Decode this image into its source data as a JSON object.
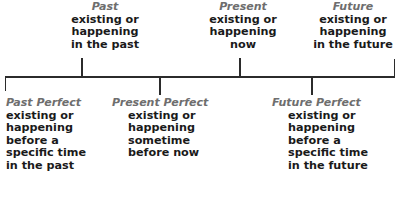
{
  "diagram": {
    "line_color": "#2b2b2b",
    "name_color": "#6e6e6e",
    "text_color": "#1a1a1a",
    "background": "#ffffff"
  },
  "upper_row": {
    "past": {
      "name": "Past",
      "line1": "existing or",
      "line2": "happening",
      "line3": "in the past"
    },
    "present": {
      "name": "Present",
      "line1": "existing or",
      "line2": "happening",
      "line3": "now"
    },
    "future": {
      "name": "Future",
      "line1": "existing or",
      "line2": "happening",
      "line3": "in the future"
    }
  },
  "lower_row": {
    "past_perfect": {
      "name": "Past Perfect",
      "line1": "existing or",
      "line2": "happening",
      "line3": "before a",
      "line4": "specific time",
      "line5": "in the past"
    },
    "present_perfect": {
      "name": "Present Perfect",
      "line1": "existing or",
      "line2": "happening",
      "line3": "sometime",
      "line4": "before now",
      "line5": ""
    },
    "future_perfect": {
      "name": "Future Perfect",
      "line1": "existing or",
      "line2": "happening",
      "line3": "before a",
      "line4": "specific time",
      "line5": "in the future"
    }
  }
}
